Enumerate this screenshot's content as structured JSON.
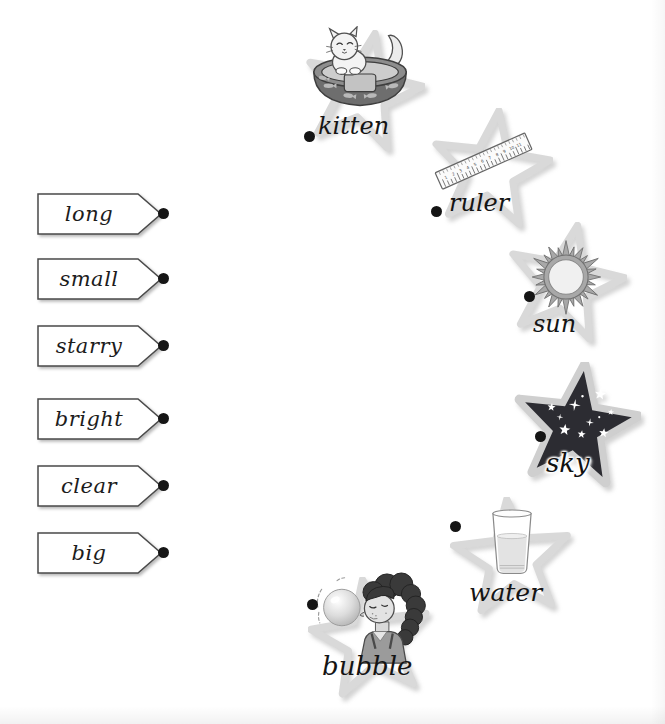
{
  "worksheet": {
    "kind": "match-adjective-to-noun exercise",
    "adjectives": [
      {
        "id": "long",
        "label": "long"
      },
      {
        "id": "small",
        "label": "small"
      },
      {
        "id": "starry",
        "label": "starry"
      },
      {
        "id": "bright",
        "label": "bright"
      },
      {
        "id": "clear",
        "label": "clear"
      },
      {
        "id": "big",
        "label": "big"
      }
    ],
    "nouns": [
      {
        "id": "kitten",
        "label": "kitten",
        "icon": "kitten-in-basket-icon"
      },
      {
        "id": "ruler",
        "label": "ruler",
        "icon": "ruler-icon"
      },
      {
        "id": "sun",
        "label": "sun",
        "icon": "sun-icon"
      },
      {
        "id": "sky",
        "label": "sky",
        "icon": "starry-night-sky-icon"
      },
      {
        "id": "water",
        "label": "water",
        "icon": "glass-of-water-icon"
      },
      {
        "id": "bubble",
        "label": "bubble",
        "icon": "girl-blowing-bubble-icon"
      }
    ],
    "colors": {
      "tag_fill": "#ffffff",
      "tag_border": "#4a4a4a",
      "connector_dot": "#151515",
      "star_outline": "#d9d9d9",
      "sky_star_fill": "#2c2c32",
      "label_text": "#1c1c1c"
    }
  }
}
